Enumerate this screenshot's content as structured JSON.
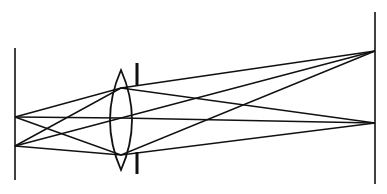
{
  "diagram": {
    "colors": {
      "background": "#ffffff",
      "stroke": "#111111"
    },
    "object_plane": {
      "x": 15,
      "y1": 48,
      "y2": 180
    },
    "image_plane": {
      "x": 375,
      "y1": 12,
      "y2": 184
    },
    "lens": {
      "cx": 121,
      "top": 70,
      "bottom": 170,
      "half_width": 11
    },
    "aperture_stop": {
      "x": 137,
      "upper": [
        63,
        86
      ],
      "lower": [
        152,
        174
      ]
    },
    "object_points": [
      {
        "x": 15,
        "y": 117
      },
      {
        "x": 15,
        "y": 146
      }
    ],
    "image_points": [
      {
        "x": 375,
        "y": 51
      },
      {
        "x": 375,
        "y": 123
      }
    ],
    "rays": [
      {
        "from": [
          15,
          117
        ],
        "via": [
          121,
          88
        ],
        "to": [
          375,
          123
        ]
      },
      {
        "from": [
          15,
          117
        ],
        "via": [
          121,
          118
        ],
        "to": [
          375,
          123
        ]
      },
      {
        "from": [
          15,
          117
        ],
        "via": [
          121,
          155
        ],
        "to": [
          375,
          123
        ]
      },
      {
        "from": [
          15,
          146
        ],
        "via": [
          121,
          88
        ],
        "to": [
          375,
          51
        ]
      },
      {
        "from": [
          15,
          146
        ],
        "via": [
          121,
          118
        ],
        "to": [
          375,
          51
        ]
      },
      {
        "from": [
          15,
          146
        ],
        "via": [
          121,
          155
        ],
        "to": [
          375,
          51
        ]
      }
    ]
  }
}
